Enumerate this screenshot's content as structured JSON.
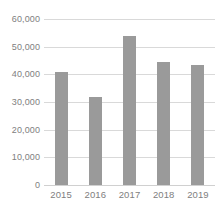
{
  "chart_data": {
    "type": "bar",
    "title": "",
    "subtitle": "",
    "xlabel": "",
    "ylabel": "",
    "categories": [
      "2015",
      "2016",
      "2017",
      "2018",
      "2019"
    ],
    "values": [
      41000,
      32000,
      54000,
      44500,
      43500
    ],
    "series": [
      {
        "name": "",
        "values": [
          41000,
          32000,
          54000,
          44500,
          43500
        ]
      }
    ],
    "ylim": [
      0,
      60000
    ],
    "xlim_categories": [
      "2015",
      "2019"
    ],
    "y_ticks": [
      0,
      10000,
      20000,
      30000,
      40000,
      50000,
      60000
    ],
    "y_tick_labels": [
      "0",
      "10,000",
      "20,000",
      "30,000",
      "40,000",
      "50,000",
      "60,000"
    ],
    "x_tick_labels": [
      "2015",
      "2016",
      "2017",
      "2018",
      "2019"
    ],
    "grid": true,
    "grid_axis": "y",
    "legend": false,
    "legend_position": "none",
    "data_labels": false,
    "annotations": [],
    "colors": {
      "bar_fill": "#9a9a9a",
      "gridline": "#d9d9d9",
      "axis_line": "#d0d0d0",
      "tick_label": "#808080",
      "background": "#ffffff"
    }
  }
}
